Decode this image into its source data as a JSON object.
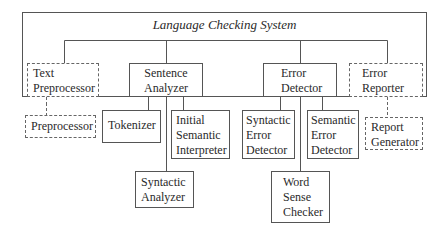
{
  "diagram": {
    "title": "Language Checking System",
    "nodes": {
      "text_preprocessor": {
        "lines": [
          "Text",
          "Preprocessor"
        ],
        "style": "dashed"
      },
      "sentence_analyzer": {
        "lines": [
          "Sentence",
          "Analyzer"
        ],
        "style": "solid"
      },
      "error_detector": {
        "lines": [
          "Error",
          "Detector"
        ],
        "style": "solid"
      },
      "error_reporter": {
        "lines": [
          "Error",
          "Reporter"
        ],
        "style": "dashed"
      },
      "preprocessor": {
        "lines": [
          "Preprocessor"
        ],
        "style": "dashed"
      },
      "tokenizer": {
        "lines": [
          "Tokenizer"
        ],
        "style": "solid"
      },
      "initial_semantic_interpreter": {
        "lines": [
          "Initial",
          "Semantic",
          "Interpreter"
        ],
        "style": "solid"
      },
      "syntactic_analyzer": {
        "lines": [
          "Syntactic",
          "Analyzer"
        ],
        "style": "solid"
      },
      "syntactic_error_detector": {
        "lines": [
          "Syntactic",
          "Error",
          "Detector"
        ],
        "style": "solid"
      },
      "semantic_error_detector": {
        "lines": [
          "Semantic",
          "Error",
          "Detector"
        ],
        "style": "solid"
      },
      "word_sense_checker": {
        "lines": [
          "Word",
          "Sense",
          "Checker"
        ],
        "style": "solid"
      },
      "report_generator": {
        "lines": [
          "Report",
          "Generator"
        ],
        "style": "dashed"
      }
    },
    "edges": [
      [
        "language_checking_system",
        "text_preprocessor"
      ],
      [
        "language_checking_system",
        "sentence_analyzer"
      ],
      [
        "language_checking_system",
        "error_detector"
      ],
      [
        "language_checking_system",
        "error_reporter"
      ],
      [
        "text_preprocessor",
        "preprocessor"
      ],
      [
        "sentence_analyzer",
        "tokenizer"
      ],
      [
        "sentence_analyzer",
        "syntactic_analyzer"
      ],
      [
        "sentence_analyzer",
        "initial_semantic_interpreter"
      ],
      [
        "error_detector",
        "syntactic_error_detector"
      ],
      [
        "error_detector",
        "word_sense_checker"
      ],
      [
        "error_detector",
        "semantic_error_detector"
      ],
      [
        "error_reporter",
        "report_generator"
      ]
    ]
  }
}
